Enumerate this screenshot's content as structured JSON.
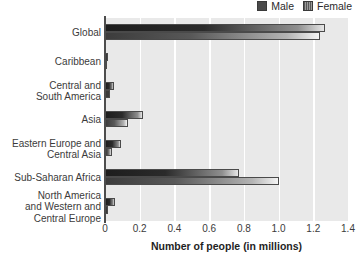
{
  "chart_data": {
    "type": "bar",
    "orientation": "horizontal",
    "title": "",
    "xlabel": "Number of people (in millions)",
    "ylabel": "",
    "xlim": [
      0,
      1.4
    ],
    "xticks": [
      "0",
      "0.2",
      "0.4",
      "0.6",
      "0.8",
      "1.0",
      "1.2",
      "1.4"
    ],
    "xtick_values": [
      0,
      0.2,
      0.4,
      0.6,
      0.8,
      1.0,
      1.2,
      1.4
    ],
    "grid": "vertical-white-gridlines",
    "legend_position": "top-right",
    "categories": [
      "Global",
      "Caribbean",
      "Central and South America",
      "Asia",
      "Eastern Europe and Central Asia",
      "Sub-Saharan Africa",
      "North America and Western and Central Europe"
    ],
    "category_labels_multiline": [
      [
        "Global"
      ],
      [
        "Caribbean"
      ],
      [
        "Central and",
        "South America"
      ],
      [
        "Asia"
      ],
      [
        "Eastern Europe and",
        "Central Asia"
      ],
      [
        "Sub-Saharan Africa"
      ],
      [
        "North America",
        "and Western and",
        "Central Europe"
      ]
    ],
    "series": [
      {
        "name": "Male",
        "color": "#1d1d1d",
        "values": [
          1.27,
          0.02,
          0.05,
          0.22,
          0.09,
          0.77,
          0.06
        ]
      },
      {
        "name": "Female",
        "color": "#585858",
        "values": [
          1.24,
          0.01,
          0.03,
          0.13,
          0.04,
          1.0,
          0.02
        ]
      }
    ]
  },
  "legend": {
    "entries": [
      {
        "label": "Male",
        "swatch": "male-swatch-icon"
      },
      {
        "label": "Female",
        "swatch": "female-swatch-icon"
      }
    ]
  },
  "axis": {
    "x_title": "Number of people (in millions)"
  },
  "colors": {
    "plot_background": "#e9e9e9",
    "gridline": "#ffffff",
    "axis_line": "#4d4d4d",
    "male_bar": "#1d1d1d",
    "female_bar": "#585858",
    "text": "#3b3b3b"
  }
}
